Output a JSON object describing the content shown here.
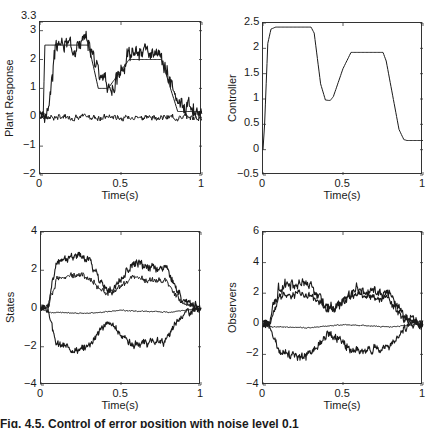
{
  "caption": "Fig. 4.5. Control of error position with noise level 0.1",
  "chart_data": [
    {
      "type": "line",
      "id": "plant",
      "title": "",
      "xlabel": "Time(s)",
      "ylabel": "Plant Response",
      "xlim": [
        0,
        1
      ],
      "ylim": [
        -2,
        3.3
      ],
      "xticks": [
        0,
        0.5,
        1
      ],
      "xtick_labels": [
        "0",
        "0.5",
        "1"
      ],
      "yticks": [
        -2,
        -1,
        0,
        1,
        2,
        3,
        3.3
      ],
      "ytick_labels": [
        "−2",
        "−1",
        "0",
        "1",
        "2",
        "3",
        "3.3"
      ],
      "grid": false,
      "series": [
        {
          "name": "reference",
          "noise": 0,
          "x": [
            0,
            0.02,
            0.03,
            0.3,
            0.36,
            0.42,
            0.55,
            0.75,
            0.85,
            1.0
          ],
          "y": [
            0,
            0,
            2.5,
            2.5,
            1.0,
            1.0,
            2.0,
            2.0,
            0.2,
            0.2
          ]
        },
        {
          "name": "response",
          "noise": 0.35,
          "x": [
            0,
            0.03,
            0.05,
            0.1,
            0.3,
            0.4,
            0.45,
            0.55,
            0.6,
            0.75,
            0.85,
            0.95,
            1.0
          ],
          "y": [
            0.2,
            0,
            0.3,
            2.5,
            2.6,
            1.2,
            1.0,
            2.2,
            2.3,
            2.0,
            0.6,
            0.3,
            0
          ],
          "seed": 3
        },
        {
          "name": "error",
          "noise": 0.12,
          "x": [
            0,
            1
          ],
          "y": [
            0,
            0
          ],
          "seed": 7
        }
      ]
    },
    {
      "type": "line",
      "id": "controller",
      "xlabel": "Time(s)",
      "ylabel": "Controller",
      "xlim": [
        0,
        1
      ],
      "ylim": [
        -0.5,
        2.5
      ],
      "xticks": [
        0,
        0.5,
        1
      ],
      "xtick_labels": [
        "0",
        "0.5",
        "1"
      ],
      "yticks": [
        -0.5,
        0,
        0.5,
        1,
        1.5,
        2,
        2.5
      ],
      "ytick_labels": [
        "−0.5",
        "0",
        "0.5",
        "1",
        "1.5",
        "2",
        "2.5"
      ],
      "grid": false,
      "series": [
        {
          "name": "u",
          "noise": 0,
          "smooth": true,
          "x": [
            0,
            0.01,
            0.03,
            0.05,
            0.08,
            0.3,
            0.32,
            0.36,
            0.39,
            0.42,
            0.44,
            0.5,
            0.55,
            0.75,
            0.77,
            0.85,
            0.88,
            0.9,
            1.0
          ],
          "y": [
            0,
            0.5,
            2.1,
            2.38,
            2.42,
            2.42,
            2.3,
            1.3,
            0.98,
            0.97,
            1.05,
            1.6,
            1.92,
            1.92,
            1.75,
            0.4,
            0.2,
            0.18,
            0.18
          ]
        }
      ]
    },
    {
      "type": "line",
      "id": "states",
      "xlabel": "Time(s)",
      "ylabel": "States",
      "xlim": [
        0,
        1
      ],
      "ylim": [
        -4,
        4
      ],
      "xticks": [
        0,
        0.5,
        1
      ],
      "xtick_labels": [
        "0",
        "0.5",
        "1"
      ],
      "yticks": [
        -4,
        -2,
        0,
        2,
        4
      ],
      "ytick_labels": [
        "−4",
        "−2",
        "0",
        "2",
        "4"
      ],
      "grid": false,
      "series": [
        {
          "name": "x1",
          "noise": 0.28,
          "seed": 11,
          "x": [
            0,
            0.04,
            0.1,
            0.25,
            0.3,
            0.4,
            0.45,
            0.57,
            0.78,
            0.88,
            1.0
          ],
          "y": [
            0,
            0,
            2.5,
            2.8,
            2.6,
            1.0,
            1.0,
            2.3,
            2.1,
            0.5,
            0
          ]
        },
        {
          "name": "x2",
          "noise": 0.2,
          "seed": 12,
          "x": [
            0,
            0.04,
            0.1,
            0.25,
            0.3,
            0.4,
            0.45,
            0.57,
            0.78,
            0.88,
            1.0
          ],
          "y": [
            0,
            0,
            1.6,
            1.8,
            1.6,
            0.8,
            0.9,
            1.6,
            1.4,
            0.3,
            0
          ]
        },
        {
          "name": "x3",
          "noise": 0.03,
          "seed": 13,
          "x": [
            0,
            0.05,
            0.3,
            0.5,
            0.8,
            1.0
          ],
          "y": [
            0,
            -0.2,
            -0.25,
            -0.1,
            -0.2,
            0
          ]
        },
        {
          "name": "x4",
          "noise": 0.25,
          "seed": 14,
          "x": [
            0,
            0.04,
            0.1,
            0.25,
            0.3,
            0.4,
            0.45,
            0.57,
            0.78,
            0.88,
            1.0
          ],
          "y": [
            0,
            0,
            -1.9,
            -2.2,
            -1.9,
            -0.8,
            -0.9,
            -1.9,
            -1.7,
            -0.3,
            0
          ]
        }
      ]
    },
    {
      "type": "line",
      "id": "observers",
      "xlabel": "Time(s)",
      "ylabel": "Observers",
      "xlim": [
        0,
        1
      ],
      "ylim": [
        -4,
        6
      ],
      "xticks": [
        0,
        0.5,
        1
      ],
      "xtick_labels": [
        "0",
        "0.5",
        "1"
      ],
      "yticks": [
        -4,
        -2,
        0,
        2,
        4,
        6
      ],
      "ytick_labels": [
        "−4",
        "−2",
        "0",
        "2",
        "4",
        "6"
      ],
      "grid": false,
      "series": [
        {
          "name": "z1",
          "noise": 0.45,
          "seed": 21,
          "x": [
            0,
            0.04,
            0.1,
            0.25,
            0.3,
            0.4,
            0.45,
            0.57,
            0.78,
            0.88,
            1.0
          ],
          "y": [
            0,
            0,
            2.5,
            2.7,
            2.5,
            1.1,
            1.0,
            2.2,
            2.0,
            0.5,
            0
          ]
        },
        {
          "name": "z2",
          "noise": 0.3,
          "seed": 22,
          "x": [
            0,
            0.04,
            0.1,
            0.25,
            0.3,
            0.4,
            0.45,
            0.57,
            0.78,
            0.88,
            1.0
          ],
          "y": [
            0,
            0,
            1.8,
            2.0,
            1.8,
            1.0,
            1.0,
            1.9,
            1.6,
            0.3,
            0
          ]
        },
        {
          "name": "z3",
          "noise": 0.04,
          "seed": 23,
          "x": [
            0,
            0.05,
            0.3,
            0.5,
            0.8,
            1.0
          ],
          "y": [
            0,
            -0.2,
            -0.25,
            -0.05,
            -0.2,
            0
          ]
        },
        {
          "name": "z4",
          "noise": 0.35,
          "seed": 24,
          "x": [
            0,
            0.04,
            0.1,
            0.25,
            0.3,
            0.4,
            0.45,
            0.57,
            0.78,
            0.88,
            1.0
          ],
          "y": [
            0,
            0,
            -1.9,
            -2.1,
            -1.9,
            -0.8,
            -0.9,
            -1.8,
            -1.6,
            -0.3,
            0
          ]
        }
      ]
    }
  ]
}
